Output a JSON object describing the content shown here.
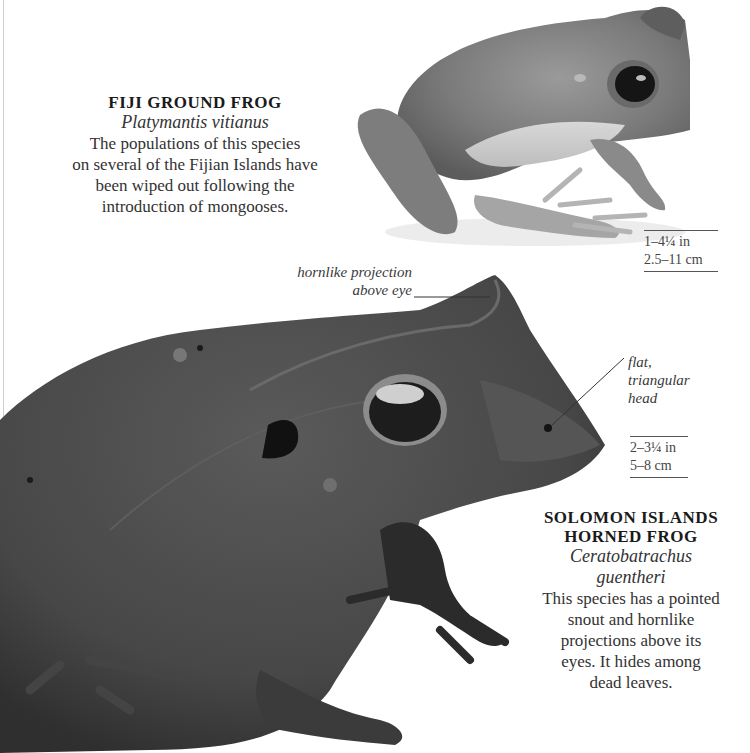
{
  "page": {
    "background": "#ffffff",
    "text_color": "#2a2a2a"
  },
  "fiji": {
    "common_name": "FIJI GROUND FROG",
    "scientific_name": "Platymantis vitianus",
    "description_lines": [
      "The populations of this species",
      "on several of the Fijian Islands have",
      "been wiped out following the",
      "introduction of mongooses."
    ],
    "size_imperial": "1–4¼ in",
    "size_metric": "2.5–11 cm",
    "image_icon": "fiji-ground-frog-photo"
  },
  "solomon": {
    "common_name_lines": [
      "SOLOMON ISLANDS",
      "HORNED FROG"
    ],
    "scientific_name_lines": [
      "Ceratobatrachus",
      "guentheri"
    ],
    "description_lines": [
      "This species has a pointed",
      "snout and hornlike",
      "projections above its",
      "eyes. It hides among",
      "dead leaves."
    ],
    "size_imperial": "2–3¼ in",
    "size_metric": "5–8 cm",
    "image_icon": "solomon-islands-horned-frog-photo",
    "callouts": {
      "horn": [
        "hornlike projection",
        "above eye"
      ],
      "head": [
        "flat,",
        "triangular",
        "head"
      ]
    }
  }
}
